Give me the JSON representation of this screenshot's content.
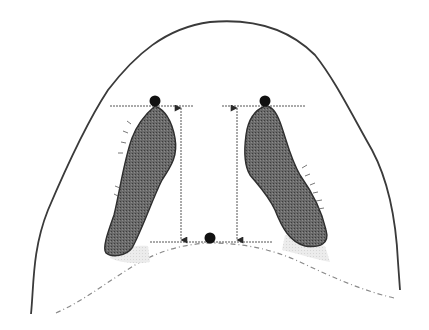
{
  "diagram": {
    "type": "anatomical-measurement-diagram",
    "title": "",
    "labels": [],
    "colors": {
      "background": "#ffffff",
      "outline": "#3a3a3a",
      "lobe_fill": "#5c5c5c",
      "lobe_stroke": "#2e2e2e",
      "shadow_fill": "#e2e2e2",
      "dashed_curve": "#8a8a8a",
      "measure_line": "#555555",
      "landmark_dot": "#111111"
    },
    "elements": {
      "outer_contour": "solid curved outline (arch)",
      "lower_contour": "dashed curved baseline",
      "left_lobe": "dark shaded elongated shape, left",
      "right_lobe": "dark shaded elongated shape, right",
      "landmarks": [
        {
          "id": "left-top-point",
          "x": 155,
          "y": 101
        },
        {
          "id": "right-top-point",
          "x": 265,
          "y": 101
        },
        {
          "id": "bottom-center-point",
          "x": 210,
          "y": 238
        }
      ],
      "measurements": [
        {
          "id": "left-vertical-measure",
          "x": 181,
          "y_from": 106,
          "y_to": 242
        },
        {
          "id": "right-vertical-measure",
          "x": 237,
          "y_from": 106,
          "y_to": 242
        }
      ],
      "reference_lines": [
        {
          "id": "left-top-reference",
          "y": 106,
          "x_from": 110,
          "x_to": 193
        },
        {
          "id": "right-top-reference",
          "y": 106,
          "x_from": 222,
          "x_to": 305
        },
        {
          "id": "bottom-reference",
          "y": 242,
          "x_from": 150,
          "x_to": 272
        }
      ]
    }
  }
}
